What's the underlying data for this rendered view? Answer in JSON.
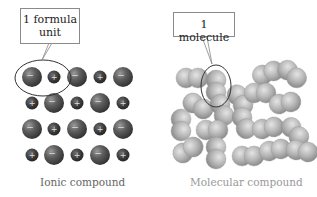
{
  "ionic": {
    "callout_line1": "1 formula",
    "callout_line2": "unit",
    "caption": "Ionic compound",
    "anion_sign": "−",
    "cation_sign": "+",
    "grid_rows": [
      [
        "anion",
        "cation",
        "anion",
        "cation",
        "anion"
      ],
      [
        "cation",
        "anion",
        "cation",
        "anion",
        "cation"
      ],
      [
        "anion",
        "cation",
        "anion",
        "cation",
        "anion"
      ],
      [
        "cation",
        "anion",
        "cation",
        "anion",
        "cation"
      ]
    ],
    "colors": {
      "anion": "#5a5a5a",
      "cation": "#3c3c3c",
      "highlight": "#d8d8d8"
    }
  },
  "molecular": {
    "callout": "1 molecule",
    "caption": "Molecular compound",
    "colors": {
      "atom": "#b8b8b8",
      "atom_shade": "#8e8e8e"
    }
  }
}
